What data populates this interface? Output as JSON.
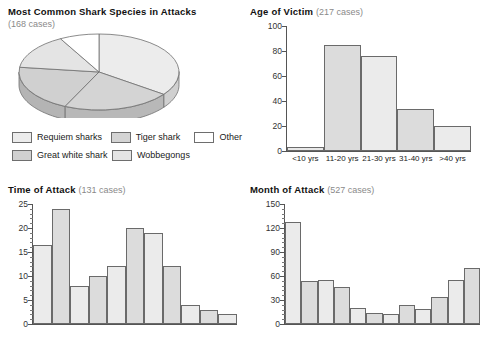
{
  "charts": {
    "pie": {
      "title": "Most Common Shark Species in Attacks",
      "subtitle": "(168 cases)",
      "legend": [
        {
          "label": "Requiem sharks",
          "color": "#ececec"
        },
        {
          "label": "Tiger shark",
          "color": "#d4d4d4"
        },
        {
          "label": "Other",
          "color": "#ffffff"
        },
        {
          "label": "Great white shark",
          "color": "#d0d0d0"
        },
        {
          "label": "Wobbegongs",
          "color": "#e4e4e4"
        }
      ]
    },
    "age": {
      "title": "Age of Victim",
      "cases": "(217 cases)"
    },
    "time": {
      "title": "Time of Attack",
      "cases": "(131 cases)"
    },
    "month": {
      "title": "Month of Attack",
      "cases": "(527 cases)"
    }
  },
  "chart_data": [
    {
      "type": "pie",
      "title": "Most Common Shark Species in Attacks",
      "subtitle": "(168 cases)",
      "total_cases": 168,
      "labels": [
        "Requiem sharks",
        "Tiger shark",
        "Great white shark",
        "Wobbegongs",
        "Other"
      ],
      "values": [
        35,
        22,
        20,
        15,
        8
      ],
      "unit": "percent",
      "colors": [
        "#ececec",
        "#d4d4d4",
        "#d0d0d0",
        "#e4e4e4",
        "#ffffff"
      ],
      "legend_position": "bottom",
      "three_d": true
    },
    {
      "type": "bar",
      "title": "Age of Victim",
      "subtitle": "(217 cases)",
      "total_cases": 217,
      "categories": [
        "<10 yrs",
        "11-20 yrs",
        "21-30 yrs",
        "31-40 yrs",
        ">40 yrs"
      ],
      "values": [
        3,
        85,
        76,
        34,
        20
      ],
      "xlabel": "",
      "ylabel": "",
      "ylim": [
        0,
        100
      ],
      "yticks": [
        0,
        20,
        40,
        60,
        80,
        100
      ],
      "grid": false,
      "bar_colors": [
        "#e8e8e8",
        "#dcdcdc",
        "#ebebeb",
        "#dcdcdc",
        "#ebebeb"
      ]
    },
    {
      "type": "bar",
      "title": "Time of Attack",
      "subtitle": "(131 cases)",
      "total_cases": 131,
      "categories": [
        "",
        "",
        "",
        "",
        "",
        "",
        "",
        "",
        "",
        "",
        ""
      ],
      "values": [
        16.5,
        24,
        8,
        10,
        12,
        20,
        19,
        12,
        4,
        3,
        2
      ],
      "xlabel": "",
      "ylabel": "",
      "ylim": [
        0,
        25
      ],
      "yticks": [
        0,
        5,
        10,
        15,
        20,
        25
      ],
      "minor_ticks": true,
      "grid": false,
      "bar_colors": [
        "#ebebeb",
        "#dcdcdc",
        "#ebebeb",
        "#dcdcdc",
        "#ebebeb",
        "#dcdcdc",
        "#ebebeb",
        "#dcdcdc",
        "#ebebeb",
        "#dcdcdc",
        "#ebebeb"
      ]
    },
    {
      "type": "bar",
      "title": "Month of Attack",
      "subtitle": "(527 cases)",
      "total_cases": 527,
      "categories": [
        "",
        "",
        "",
        "",
        "",
        "",
        "",
        "",
        "",
        "",
        "",
        ""
      ],
      "values": [
        128,
        54,
        55,
        46,
        20,
        14,
        12,
        24,
        19,
        34,
        55,
        70
      ],
      "xlabel": "",
      "ylabel": "",
      "ylim": [
        0,
        150
      ],
      "yticks": [
        0,
        30,
        60,
        90,
        120,
        150
      ],
      "minor_ticks": true,
      "grid": false,
      "bar_colors": [
        "#ebebeb",
        "#dcdcdc",
        "#ebebeb",
        "#dcdcdc",
        "#ebebeb",
        "#dcdcdc",
        "#ebebeb",
        "#dcdcdc",
        "#ebebeb",
        "#dcdcdc",
        "#ebebeb",
        "#dcdcdc"
      ]
    }
  ]
}
